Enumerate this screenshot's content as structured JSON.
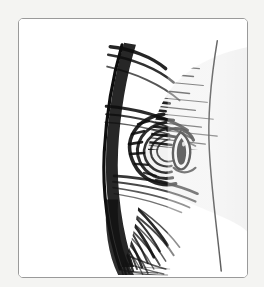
{
  "artwork": {
    "title": "",
    "caption": "",
    "medium": "pen-and-ink cross-hatch drawing",
    "subject": "close-up of an animal eye in profile",
    "orientation": "portrait"
  },
  "frame": {
    "label": "",
    "border_color": "#9a9a9a",
    "corner_radius_px": 5,
    "inner_background": "#ffffff",
    "outer_background": "#f4f4f2",
    "x": 18,
    "y": 18,
    "width": 230,
    "height": 260
  },
  "palette": {
    "ink": "#141414",
    "ink_mid": "#3a3a3a",
    "ink_light": "#6e6e6e",
    "paper": "#ffffff",
    "mat": "#f4f4f2",
    "frame_line": "#9a9a9a"
  },
  "drawing": {
    "contour_right": {
      "name": "muzzle-contour-line",
      "description": "thin curved vertical contour from top to bottom, right of center"
    },
    "shaded_mass": {
      "name": "hatched-fur-mass",
      "description": "dense horizontal and radiating hatch strokes forming the shaded side of the head"
    },
    "eye": {
      "name": "eye",
      "center_x": 148,
      "center_y": 130,
      "description": "almond-shaped eye with dark pupil and concentric lid hatching"
    }
  }
}
